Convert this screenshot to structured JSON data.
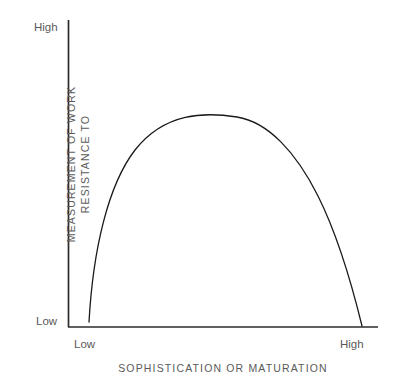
{
  "chart_data": {
    "type": "line",
    "title": "",
    "subtitle": "",
    "xlabel": "SOPHISTICATION OR MATURATION",
    "ylabel_lines": [
      "RESISTANCE TO",
      "MEASUREMENT OF WORK"
    ],
    "ylabel": "RESISTANCE TO MEASUREMENT OF WORK",
    "x_tick_labels": [
      "Low",
      "High"
    ],
    "y_tick_labels": [
      "Low",
      "High"
    ],
    "xlim": [
      "Low",
      "High"
    ],
    "ylim": [
      "Low",
      "High"
    ],
    "grid": false,
    "legend": null,
    "annotations": [],
    "series": [
      {
        "name": "resistance curve",
        "shape": "inverted-parabola",
        "stroke": "#1a1a1a",
        "stroke_width": 1.3,
        "points": [
          {
            "x": 0.07,
            "y": 0.02
          },
          {
            "x": 0.12,
            "y": 0.22
          },
          {
            "x": 0.2,
            "y": 0.42
          },
          {
            "x": 0.3,
            "y": 0.62
          },
          {
            "x": 0.4,
            "y": 0.78
          },
          {
            "x": 0.5,
            "y": 0.91
          },
          {
            "x": 0.55,
            "y": 0.97
          },
          {
            "x": 0.6,
            "y": 0.99
          },
          {
            "x": 0.66,
            "y": 0.97
          },
          {
            "x": 0.74,
            "y": 0.88
          },
          {
            "x": 0.82,
            "y": 0.72
          },
          {
            "x": 0.88,
            "y": 0.53
          },
          {
            "x": 0.93,
            "y": 0.31
          },
          {
            "x": 0.96,
            "y": 0.01
          }
        ],
        "path": "M 89 322 C 93 250 108 185 135 150 C 165 112 205 112 237 117 C 268 122 296 152 318 196 C 338 236 352 285 362 326"
      }
    ],
    "axes": {
      "color": "#2b2b2b",
      "x_axis": {
        "x1": 68,
        "y1": 327,
        "x2": 378,
        "y2": 327
      },
      "y_axis": {
        "x1": 68,
        "y1": 20,
        "x2": 68,
        "y2": 327
      }
    }
  },
  "figure": {
    "background": "#ffffff",
    "text_color": "#5a5a5a"
  }
}
